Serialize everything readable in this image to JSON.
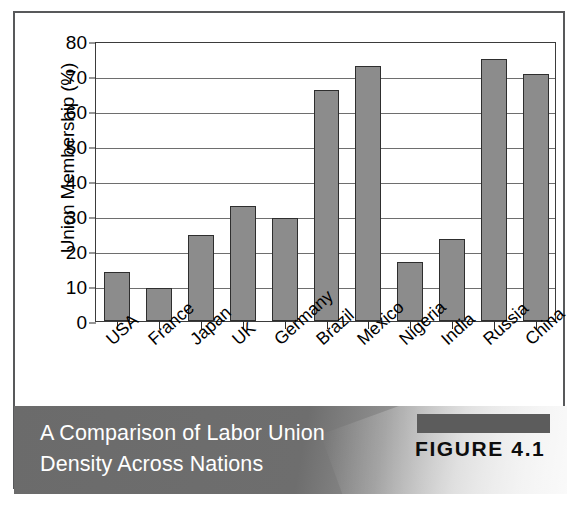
{
  "figure": {
    "caption_line1": "A Comparison of Labor Union",
    "caption_line2": "Density Across Nations",
    "figure_number": "FIGURE 4.1"
  },
  "colors": {
    "bar_fill": "#8c8c8c",
    "bar_outline": "#2e2e2e",
    "gridline": "#6e6e6e",
    "panel_border": "#58595b",
    "caption_text": "#ffffff",
    "caption_band_dark": "#6b6b6b",
    "caption_band_light": "#ededed",
    "figure_accent": "#5c5c5c"
  },
  "chart_data": {
    "type": "bar",
    "title": "A Comparison of Labor Union Density Across Nations",
    "xlabel": "",
    "ylabel": "Union Membership (%)",
    "ylim": [
      0,
      80
    ],
    "ytick_step": 10,
    "yticks": [
      0,
      10,
      20,
      30,
      40,
      50,
      60,
      70,
      80
    ],
    "grid": true,
    "legend": false,
    "categories": [
      "USA",
      "France",
      "Japan",
      "UK",
      "Germany",
      "Brazil",
      "Mexico",
      "Nigeria",
      "India",
      "Russia",
      "China"
    ],
    "values": [
      14,
      9.5,
      24.5,
      33,
      29.5,
      66,
      73,
      17,
      23.5,
      75,
      70.5
    ]
  }
}
